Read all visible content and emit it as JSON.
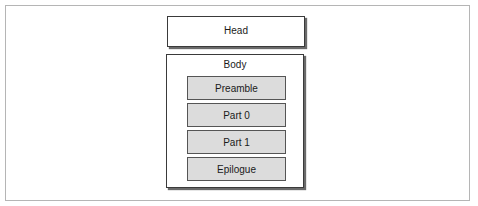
{
  "diagram": {
    "head": {
      "label": "Head"
    },
    "body": {
      "label": "Body",
      "parts": [
        {
          "label": "Preamble"
        },
        {
          "label": "Part 0"
        },
        {
          "label": "Part 1"
        },
        {
          "label": "Epilogue"
        }
      ]
    }
  },
  "colors": {
    "part_fill": "#dcdcdc",
    "border": "#3a3a3a",
    "frame": "#b5b5b5"
  }
}
